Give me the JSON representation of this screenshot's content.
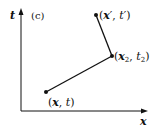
{
  "figure": {
    "panel_label": "(c)",
    "axes": {
      "vertical_label": "t",
      "horizontal_label": "x"
    },
    "points": [
      {
        "id": "p1",
        "label": "(x, t)",
        "x": 46,
        "y": 92
      },
      {
        "id": "p2",
        "label": "(x2, t2)",
        "x": 112,
        "y": 56
      },
      {
        "id": "p3",
        "label": "(x', t')",
        "x": 96,
        "y": 15
      }
    ],
    "segments": [
      {
        "from": "p1",
        "to": "p2"
      },
      {
        "from": "p2",
        "to": "p3"
      }
    ],
    "colors": {
      "ink": "#111111",
      "background": "#ffffff"
    }
  }
}
